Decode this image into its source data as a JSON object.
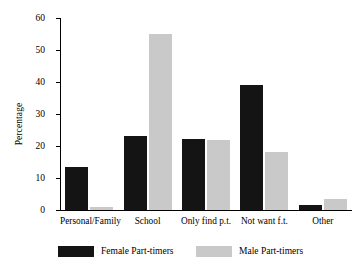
{
  "chart_data": {
    "type": "bar",
    "title": "",
    "xlabel": "",
    "ylabel": "Percentage",
    "ylim": [
      0,
      60
    ],
    "yticks": [
      0,
      10,
      20,
      30,
      40,
      50,
      60
    ],
    "grid": false,
    "legend_position": "bottom",
    "categories": [
      "Personal/Family",
      "School",
      "Only find p.t.",
      "Not want f.t.",
      "Other"
    ],
    "series": [
      {
        "name": "Female Part-timers",
        "color": "#141414",
        "values": [
          13.4,
          23.1,
          22.2,
          39.2,
          1.6
        ]
      },
      {
        "name": "Male Part-timers",
        "color": "#c9c9c9",
        "values": [
          0.8,
          55.0,
          21.8,
          18.2,
          3.3
        ]
      }
    ]
  },
  "axis": {
    "y_title": "Percentage",
    "y_tick_labels": [
      "0",
      "10",
      "20",
      "30",
      "40",
      "50",
      "60"
    ]
  },
  "legend": {
    "entries": [
      {
        "label": "Female Part-timers",
        "color": "#141414"
      },
      {
        "label": "Male Part-timers",
        "color": "#c9c9c9"
      }
    ]
  }
}
